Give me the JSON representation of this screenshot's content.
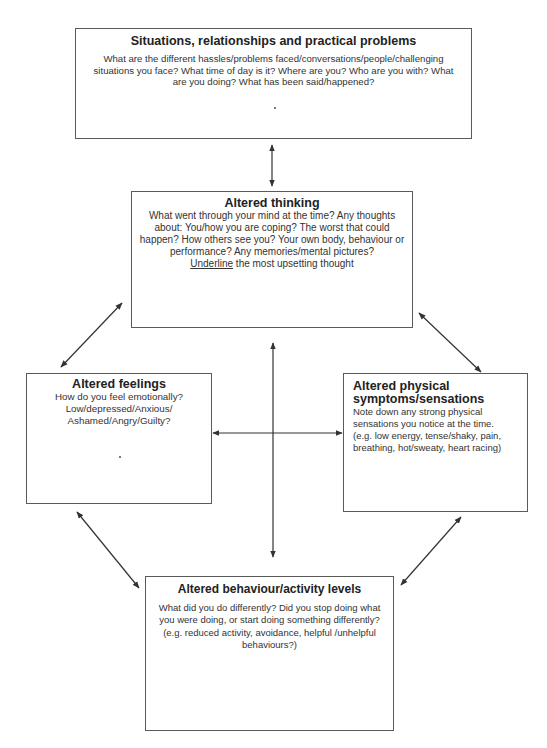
{
  "diagram": {
    "type": "five-areas-cbt-model",
    "colors": {
      "border": "#5a5a5a",
      "text": "#333333",
      "title": "#222222",
      "arrow": "#333333"
    },
    "boxes": {
      "situations": {
        "title": "Situations, relationships and practical problems",
        "lines": [
          "What are the different hassles/problems faced/conversations/people/challenging",
          "situations you face? What time of day is it? Where are you? Who are you with? What",
          "are you doing? What has been said/happened?"
        ]
      },
      "thinking": {
        "title": "Altered thinking",
        "lines": [
          "What went through your mind at the time? Any thoughts",
          "about: You/how you are coping? The worst that could",
          "happen? How others see you? Your own body, behaviour or",
          "performance? Any memories/mental pictures?"
        ],
        "last_line_underlined": "Underline",
        "last_line_rest": " the most upsetting thought"
      },
      "feelings": {
        "title": "Altered feelings",
        "lines": [
          "How do you feel emotionally?",
          "Low/depressed/Anxious/",
          "Ashamed/Angry/Guilty?"
        ]
      },
      "physical": {
        "title_lines": [
          "Altered physical",
          "symptoms/sensations"
        ],
        "lines": [
          "Note down any strong physical",
          "sensations you notice at the time.",
          "(e.g. low energy, tense/shaky, pain,",
          "breathing, hot/sweaty, heart racing)"
        ]
      },
      "behaviour": {
        "title": "Altered behaviour/activity levels",
        "lines": [
          "What did you do differently? Did you stop doing what",
          "you were doing, or start doing something differently?",
          "(e.g. reduced activity, avoidance, helpful /unhelpful",
          "behaviours?)"
        ]
      }
    },
    "connections": [
      {
        "from": "situations",
        "to": "thinking",
        "bidirectional": true
      },
      {
        "from": "thinking",
        "to": "feelings",
        "bidirectional": true
      },
      {
        "from": "thinking",
        "to": "physical",
        "bidirectional": true
      },
      {
        "from": "thinking",
        "to": "behaviour",
        "bidirectional": true
      },
      {
        "from": "feelings",
        "to": "physical",
        "bidirectional": true
      },
      {
        "from": "feelings",
        "to": "behaviour",
        "bidirectional": true
      },
      {
        "from": "physical",
        "to": "behaviour",
        "bidirectional": true
      }
    ]
  }
}
